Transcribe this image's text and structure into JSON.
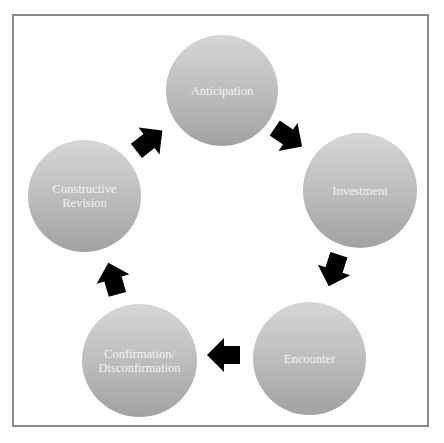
{
  "diagram": {
    "type": "cycle",
    "nodes": [
      {
        "id": "anticipation",
        "label": "Anticipation"
      },
      {
        "id": "investment",
        "label": "Investment"
      },
      {
        "id": "encounter",
        "label": "Encounter"
      },
      {
        "id": "confirmation",
        "label": "Confirmation/\nDisconfirmation"
      },
      {
        "id": "constructive-revision",
        "label": "Constructive\nRevision"
      }
    ],
    "edges": [
      {
        "from": "anticipation",
        "to": "investment"
      },
      {
        "from": "investment",
        "to": "encounter"
      },
      {
        "from": "encounter",
        "to": "confirmation"
      },
      {
        "from": "confirmation",
        "to": "constructive-revision"
      },
      {
        "from": "constructive-revision",
        "to": "anticipation"
      }
    ],
    "colors": {
      "node_top": "#d6d6d6",
      "node_bottom": "#a2a2a2",
      "node_text": "#f4f4f4",
      "arrow": "#000000",
      "frame_border": "#8a8a8a"
    }
  }
}
